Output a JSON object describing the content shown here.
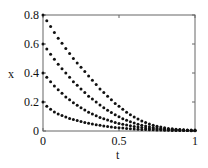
{
  "chart_data": {
    "type": "scatter",
    "title": "",
    "xlabel": "t",
    "ylabel": "x",
    "xlim": [
      0,
      1
    ],
    "ylim": [
      0,
      0.8
    ],
    "xticks": [
      "0",
      "0.5",
      "1"
    ],
    "yticks": [
      "0",
      "0.2",
      "0.4",
      "0.6",
      "0.8"
    ],
    "grid": false,
    "legend": null,
    "x": [
      0,
      0.025,
      0.05,
      0.075,
      0.1,
      0.125,
      0.15,
      0.175,
      0.2,
      0.225,
      0.25,
      0.275,
      0.3,
      0.325,
      0.35,
      0.375,
      0.4,
      0.425,
      0.45,
      0.475,
      0.5,
      0.525,
      0.55,
      0.575,
      0.6,
      0.625,
      0.65,
      0.675,
      0.7,
      0.725,
      0.75,
      0.775,
      0.8,
      0.825,
      0.85,
      0.875,
      0.9,
      0.925,
      0.95,
      0.975,
      1
    ],
    "series": [
      {
        "name": "x0=0.8",
        "values": [
          0.8,
          0.76,
          0.72,
          0.68,
          0.64,
          0.605,
          0.57,
          0.535,
          0.5,
          0.47,
          0.44,
          0.41,
          0.38,
          0.35,
          0.32,
          0.29,
          0.265,
          0.24,
          0.215,
          0.19,
          0.17,
          0.15,
          0.13,
          0.112,
          0.096,
          0.082,
          0.069,
          0.058,
          0.048,
          0.04,
          0.033,
          0.027,
          0.022,
          0.018,
          0.015,
          0.012,
          0.01,
          0.008,
          0.007,
          0.006,
          0.005
        ]
      },
      {
        "name": "x0=0.6",
        "values": [
          0.6,
          0.565,
          0.53,
          0.495,
          0.46,
          0.43,
          0.4,
          0.37,
          0.34,
          0.315,
          0.29,
          0.265,
          0.24,
          0.22,
          0.2,
          0.18,
          0.16,
          0.143,
          0.127,
          0.112,
          0.098,
          0.085,
          0.074,
          0.064,
          0.055,
          0.047,
          0.04,
          0.034,
          0.029,
          0.024,
          0.02,
          0.017,
          0.014,
          0.012,
          0.01,
          0.008,
          0.007,
          0.006,
          0.005,
          0.004,
          0.004
        ]
      },
      {
        "name": "x0=0.4",
        "values": [
          0.4,
          0.37,
          0.34,
          0.31,
          0.285,
          0.26,
          0.235,
          0.215,
          0.195,
          0.177,
          0.16,
          0.145,
          0.13,
          0.117,
          0.105,
          0.094,
          0.084,
          0.075,
          0.067,
          0.059,
          0.052,
          0.046,
          0.041,
          0.036,
          0.032,
          0.028,
          0.024,
          0.021,
          0.018,
          0.016,
          0.014,
          0.012,
          0.01,
          0.009,
          0.008,
          0.007,
          0.006,
          0.005,
          0.004,
          0.004,
          0.003
        ]
      },
      {
        "name": "x0=0.2",
        "values": [
          0.2,
          0.17,
          0.15,
          0.132,
          0.118,
          0.106,
          0.096,
          0.087,
          0.079,
          0.072,
          0.065,
          0.059,
          0.053,
          0.048,
          0.043,
          0.039,
          0.035,
          0.031,
          0.028,
          0.025,
          0.022,
          0.02,
          0.018,
          0.016,
          0.014,
          0.012,
          0.011,
          0.01,
          0.009,
          0.008,
          0.007,
          0.006,
          0.005,
          0.005,
          0.004,
          0.004,
          0.003,
          0.003,
          0.003,
          0.002,
          0.002
        ]
      }
    ],
    "plot_area": {
      "left": 43,
      "right": 195,
      "top": 15,
      "bottom": 131
    },
    "colors": {
      "marker": "#111111",
      "axis": "#555555",
      "text": "#111111"
    }
  }
}
